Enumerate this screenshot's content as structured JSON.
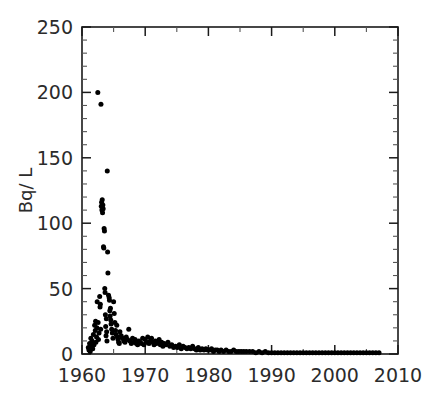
{
  "chart_data": {
    "type": "scatter",
    "title": "",
    "subtitle": "",
    "xlabel": "",
    "ylabel": "Bq/ L",
    "xlim": [
      1960,
      2010
    ],
    "ylim": [
      0,
      250
    ],
    "x_major_ticks": [
      1960,
      1970,
      1980,
      1990,
      2000,
      2010
    ],
    "x_minor_interval": 5,
    "y_major_ticks": [
      0,
      50,
      100,
      150,
      200,
      250
    ],
    "y_minor_interval": 10,
    "x_tick_labels": [
      "1960",
      "1970",
      "1980",
      "1990",
      "2000",
      "2010"
    ],
    "y_tick_labels": [
      "0",
      "50",
      "100",
      "150",
      "200",
      "250"
    ],
    "grid": false,
    "legend": null,
    "marker": {
      "shape": "circle",
      "color": "#000000",
      "size_px": 5
    },
    "series": [
      {
        "name": "Tritium concentration",
        "points": [
          [
            1961.0,
            5
          ],
          [
            1961.1,
            3
          ],
          [
            1961.2,
            8
          ],
          [
            1961.3,
            2
          ],
          [
            1961.4,
            12
          ],
          [
            1961.5,
            6
          ],
          [
            1961.6,
            10
          ],
          [
            1961.7,
            4
          ],
          [
            1961.8,
            15
          ],
          [
            1961.9,
            7
          ],
          [
            1962.0,
            22
          ],
          [
            1962.1,
            18
          ],
          [
            1962.15,
            25
          ],
          [
            1962.2,
            9
          ],
          [
            1962.3,
            13
          ],
          [
            1962.35,
            20
          ],
          [
            1962.4,
            40
          ],
          [
            1962.5,
            200
          ],
          [
            1962.55,
            24
          ],
          [
            1962.6,
            11
          ],
          [
            1962.7,
            16
          ],
          [
            1962.8,
            44
          ],
          [
            1962.85,
            36
          ],
          [
            1962.9,
            38
          ],
          [
            1962.95,
            19
          ],
          [
            1963.0,
            191
          ],
          [
            1963.05,
            113
          ],
          [
            1963.1,
            116
          ],
          [
            1963.15,
            110
          ],
          [
            1963.2,
            118
          ],
          [
            1963.25,
            108
          ],
          [
            1963.3,
            114
          ],
          [
            1963.35,
            111
          ],
          [
            1963.4,
            82
          ],
          [
            1963.45,
            81
          ],
          [
            1963.5,
            96
          ],
          [
            1963.55,
            94
          ],
          [
            1963.6,
            50
          ],
          [
            1963.65,
            47
          ],
          [
            1963.7,
            30
          ],
          [
            1963.75,
            21
          ],
          [
            1963.8,
            14
          ],
          [
            1963.85,
            27
          ],
          [
            1963.9,
            17
          ],
          [
            1963.95,
            10
          ],
          [
            1964.0,
            140
          ],
          [
            1964.05,
            78
          ],
          [
            1964.1,
            62
          ],
          [
            1964.2,
            45
          ],
          [
            1964.3,
            43
          ],
          [
            1964.35,
            41
          ],
          [
            1964.4,
            33
          ],
          [
            1964.45,
            29
          ],
          [
            1964.5,
            35
          ],
          [
            1964.55,
            26
          ],
          [
            1964.6,
            23
          ],
          [
            1964.7,
            19
          ],
          [
            1964.8,
            16
          ],
          [
            1964.9,
            12
          ],
          [
            1965.0,
            40
          ],
          [
            1965.1,
            31
          ],
          [
            1965.2,
            24
          ],
          [
            1965.3,
            18
          ],
          [
            1965.4,
            15
          ],
          [
            1965.5,
            22
          ],
          [
            1965.6,
            13
          ],
          [
            1965.7,
            11
          ],
          [
            1965.8,
            9
          ],
          [
            1965.9,
            8
          ],
          [
            1966.0,
            17
          ],
          [
            1966.2,
            14
          ],
          [
            1966.4,
            12
          ],
          [
            1966.6,
            10
          ],
          [
            1966.8,
            9
          ],
          [
            1967.0,
            13
          ],
          [
            1967.2,
            11
          ],
          [
            1967.4,
            19
          ],
          [
            1967.6,
            10
          ],
          [
            1967.8,
            8
          ],
          [
            1968.0,
            12
          ],
          [
            1968.2,
            9
          ],
          [
            1968.4,
            11
          ],
          [
            1968.6,
            8
          ],
          [
            1968.8,
            7
          ],
          [
            1969.0,
            10
          ],
          [
            1969.2,
            9
          ],
          [
            1969.4,
            8
          ],
          [
            1969.6,
            12
          ],
          [
            1969.8,
            7
          ],
          [
            1970.0,
            11
          ],
          [
            1970.2,
            9
          ],
          [
            1970.4,
            13
          ],
          [
            1970.6,
            8
          ],
          [
            1970.8,
            10
          ],
          [
            1971.0,
            12
          ],
          [
            1971.2,
            9
          ],
          [
            1971.4,
            7
          ],
          [
            1971.6,
            10
          ],
          [
            1971.8,
            8
          ],
          [
            1972.0,
            9
          ],
          [
            1972.2,
            11
          ],
          [
            1972.4,
            7
          ],
          [
            1972.6,
            9
          ],
          [
            1972.8,
            6
          ],
          [
            1973.0,
            8
          ],
          [
            1973.3,
            7
          ],
          [
            1973.6,
            9
          ],
          [
            1973.9,
            6
          ],
          [
            1974.2,
            7
          ],
          [
            1974.5,
            5
          ],
          [
            1974.8,
            6
          ],
          [
            1975.1,
            5
          ],
          [
            1975.4,
            7
          ],
          [
            1975.7,
            4
          ],
          [
            1976.0,
            6
          ],
          [
            1976.3,
            5
          ],
          [
            1976.6,
            4
          ],
          [
            1976.9,
            5
          ],
          [
            1977.2,
            4
          ],
          [
            1977.5,
            6
          ],
          [
            1977.8,
            4
          ],
          [
            1978.1,
            3
          ],
          [
            1978.4,
            5
          ],
          [
            1978.7,
            3
          ],
          [
            1979.0,
            4
          ],
          [
            1979.3,
            3
          ],
          [
            1979.6,
            4
          ],
          [
            1979.9,
            3
          ],
          [
            1980.2,
            3
          ],
          [
            1980.5,
            4
          ],
          [
            1980.8,
            2
          ],
          [
            1981.1,
            3
          ],
          [
            1981.4,
            3
          ],
          [
            1981.7,
            2
          ],
          [
            1982.0,
            3
          ],
          [
            1982.4,
            2
          ],
          [
            1982.8,
            3
          ],
          [
            1983.2,
            2
          ],
          [
            1983.6,
            2
          ],
          [
            1984.0,
            3
          ],
          [
            1984.4,
            2
          ],
          [
            1984.8,
            2
          ],
          [
            1985.2,
            2
          ],
          [
            1985.6,
            2
          ],
          [
            1986.0,
            2
          ],
          [
            1986.5,
            2
          ],
          [
            1987.0,
            2
          ],
          [
            1987.5,
            1
          ],
          [
            1988.0,
            2
          ],
          [
            1988.5,
            1
          ],
          [
            1989.0,
            2
          ],
          [
            1989.5,
            1
          ],
          [
            1990.0,
            1
          ],
          [
            1990.5,
            1
          ],
          [
            1991.0,
            1
          ],
          [
            1991.5,
            1
          ],
          [
            1992.0,
            1
          ],
          [
            1992.5,
            1
          ],
          [
            1993.0,
            1
          ],
          [
            1993.5,
            1
          ],
          [
            1994.0,
            1
          ],
          [
            1994.5,
            1
          ],
          [
            1995.0,
            1
          ],
          [
            1995.5,
            1
          ],
          [
            1996.0,
            1
          ],
          [
            1996.5,
            1
          ],
          [
            1997.0,
            1
          ],
          [
            1997.5,
            1
          ],
          [
            1998.0,
            1
          ],
          [
            1998.5,
            1
          ],
          [
            1999.0,
            1
          ],
          [
            1999.5,
            1
          ],
          [
            2000.0,
            1
          ],
          [
            2000.5,
            1
          ],
          [
            2001.0,
            1
          ],
          [
            2001.5,
            1
          ],
          [
            2002.0,
            1
          ],
          [
            2002.5,
            1
          ],
          [
            2003.0,
            1
          ],
          [
            2003.5,
            1
          ],
          [
            2004.0,
            1
          ],
          [
            2004.5,
            1
          ],
          [
            2005.0,
            1
          ],
          [
            2005.5,
            1
          ],
          [
            2006.0,
            1
          ],
          [
            2006.5,
            1
          ],
          [
            2007.0,
            1
          ]
        ]
      }
    ]
  }
}
